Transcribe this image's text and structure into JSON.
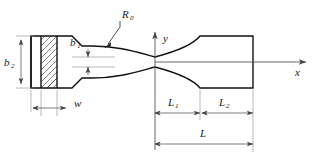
{
  "diagram": {
    "type": "engineering-drawing",
    "labels": {
      "radius": "R",
      "radius_sub": "0",
      "neck_width": "b",
      "neck_width_sub": "1",
      "grip_width": "b",
      "grip_width_sub": "2",
      "clamp_width": "w",
      "length_1": "L",
      "length_1_sub": "1",
      "length_2": "L",
      "length_2_sub": "2",
      "total_length": "L",
      "axis_x": "x",
      "axis_y": "y"
    },
    "colors": {
      "outline": "#111111",
      "dimension": "#444444",
      "extension": "#8a8a8a",
      "hatch": "#333333",
      "axis": "#555555",
      "background": "#ffffff",
      "text": "#1a1a1a"
    }
  },
  "geometry": {
    "origin_x": 155,
    "origin_y": 62,
    "neck_half_height": 5,
    "grip_half_height": 26,
    "left_block_x0": 31,
    "left_block_x1": 60,
    "hatch_x0": 41,
    "hatch_x1": 57,
    "taper_x": 82,
    "curve_end_x": 200,
    "right_end_x": 253,
    "x_axis_end": 306,
    "y_axis_top": 32
  },
  "dimensions": [
    {
      "name": "b2",
      "orientation": "vertical",
      "from": 36,
      "to": 88,
      "at": 21
    },
    {
      "name": "b1",
      "orientation": "vertical",
      "from": 57,
      "to": 67,
      "at": 88
    },
    {
      "name": "w",
      "orientation": "horizontal",
      "from": 37,
      "to": 60,
      "at": 108
    },
    {
      "name": "L1",
      "orientation": "horizontal",
      "from": 155,
      "to": 200,
      "at": 113
    },
    {
      "name": "L2",
      "orientation": "horizontal",
      "from": 200,
      "to": 253,
      "at": 113
    },
    {
      "name": "L",
      "orientation": "horizontal",
      "from": 155,
      "to": 253,
      "at": 144
    }
  ]
}
